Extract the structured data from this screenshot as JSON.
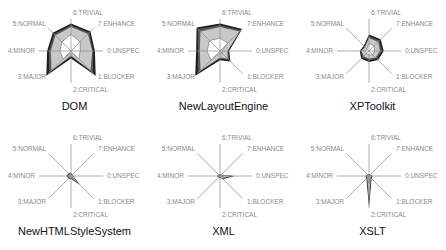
{
  "axes": [
    "0:UNSPEC",
    "1:BLOCKER",
    "2:CRITICAL",
    "3:MAJOR",
    "4:MINOR",
    "5:NORMAL",
    "6:TRIVIAL",
    "7:ENHANCE"
  ],
  "colors": {
    "outer": "#1e1e1e",
    "middle": "#5a5a5a",
    "fill": "#c8c8c8",
    "inner": "#ffffff",
    "axis": "#8c8c8c",
    "label": "#8a8a8a"
  },
  "chart_data": [
    {
      "type": "radar",
      "title": "DOM",
      "axes": [
        "0:UNSPEC",
        "1:BLOCKER",
        "2:CRITICAL",
        "3:MAJOR",
        "4:MINOR",
        "5:NORMAL",
        "6:TRIVIAL",
        "7:ENHANCE"
      ],
      "series": [
        {
          "name": "outer",
          "values": [
            0.65,
            0.75,
            0.75,
            0.7,
            0.65,
            0.95,
            0.2,
            0.95
          ]
        },
        {
          "name": "middle",
          "values": [
            0.6,
            0.7,
            0.7,
            0.65,
            0.6,
            0.85,
            0.15,
            0.85
          ]
        },
        {
          "name": "fill",
          "values": [
            0.58,
            0.65,
            0.65,
            0.6,
            0.55,
            0.75,
            0.12,
            0.75
          ]
        },
        {
          "name": "inner",
          "values": [
            0.25,
            0.35,
            0.45,
            0.35,
            0.3,
            0.3,
            0.05,
            0.3
          ]
        }
      ]
    },
    {
      "type": "radar",
      "title": "NewLayoutEngine",
      "axes": [
        "0:UNSPEC",
        "1:BLOCKER",
        "2:CRITICAL",
        "3:MAJOR",
        "4:MINOR",
        "5:NORMAL",
        "6:TRIVIAL",
        "7:ENHANCE"
      ],
      "series": [
        {
          "name": "outer",
          "values": [
            0.25,
            0.85,
            0.75,
            0.9,
            0.65,
            0.95,
            0.25,
            0.4
          ]
        },
        {
          "name": "middle",
          "values": [
            0.22,
            0.8,
            0.7,
            0.85,
            0.6,
            0.85,
            0.2,
            0.35
          ]
        },
        {
          "name": "fill",
          "values": [
            0.2,
            0.75,
            0.65,
            0.75,
            0.55,
            0.75,
            0.18,
            0.3
          ]
        },
        {
          "name": "inner",
          "values": [
            0.05,
            0.3,
            0.35,
            0.4,
            0.35,
            0.35,
            0.05,
            0.1
          ]
        }
      ]
    },
    {
      "type": "radar",
      "title": "XPToolkit",
      "axes": [
        "0:UNSPEC",
        "1:BLOCKER",
        "2:CRITICAL",
        "3:MAJOR",
        "4:MINOR",
        "5:NORMAL",
        "6:TRIVIAL",
        "7:ENHANCE"
      ],
      "series": [
        {
          "name": "outer",
          "values": [
            0.4,
            0.45,
            0.45,
            0.2,
            0.25,
            0.3,
            0.3,
            0.35
          ]
        },
        {
          "name": "middle",
          "values": [
            0.35,
            0.4,
            0.4,
            0.17,
            0.22,
            0.25,
            0.25,
            0.3
          ]
        },
        {
          "name": "fill",
          "values": [
            0.3,
            0.35,
            0.35,
            0.15,
            0.2,
            0.2,
            0.2,
            0.25
          ]
        },
        {
          "name": "inner",
          "values": [
            0.15,
            0.2,
            0.2,
            0.08,
            0.1,
            0.1,
            0.1,
            0.15
          ]
        }
      ]
    },
    {
      "type": "radar",
      "title": "NewHTMLStyleSystem",
      "axes": [
        "0:UNSPEC",
        "1:BLOCKER",
        "2:CRITICAL",
        "3:MAJOR",
        "4:MINOR",
        "5:NORMAL",
        "6:TRIVIAL",
        "7:ENHANCE"
      ],
      "series": [
        {
          "name": "outer",
          "values": [
            0.06,
            0.05,
            0.08,
            0.1,
            0.12,
            0.1,
            0.08,
            0.35
          ]
        },
        {
          "name": "middle",
          "values": [
            0.05,
            0.04,
            0.07,
            0.08,
            0.1,
            0.08,
            0.06,
            0.3
          ]
        },
        {
          "name": "fill",
          "values": [
            0.04,
            0.03,
            0.05,
            0.06,
            0.08,
            0.06,
            0.05,
            0.25
          ]
        },
        {
          "name": "inner",
          "values": [
            0.02,
            0.02,
            0.03,
            0.03,
            0.04,
            0.03,
            0.02,
            0.1
          ]
        }
      ]
    },
    {
      "type": "radar",
      "title": "XML",
      "axes": [
        "0:UNSPEC",
        "1:BLOCKER",
        "2:CRITICAL",
        "3:MAJOR",
        "4:MINOR",
        "5:NORMAL",
        "6:TRIVIAL",
        "7:ENHANCE"
      ],
      "series": [
        {
          "name": "outer",
          "values": [
            0.4,
            0.05,
            0.05,
            0.05,
            0.08,
            0.06,
            0.05,
            0.12
          ]
        },
        {
          "name": "middle",
          "values": [
            0.35,
            0.04,
            0.04,
            0.04,
            0.07,
            0.05,
            0.04,
            0.1
          ]
        },
        {
          "name": "fill",
          "values": [
            0.3,
            0.03,
            0.03,
            0.03,
            0.05,
            0.04,
            0.03,
            0.08
          ]
        },
        {
          "name": "inner",
          "values": [
            0.1,
            0.01,
            0.01,
            0.01,
            0.02,
            0.02,
            0.01,
            0.03
          ]
        }
      ]
    },
    {
      "type": "radar",
      "title": "XSLT",
      "axes": [
        "0:UNSPEC",
        "1:BLOCKER",
        "2:CRITICAL",
        "3:MAJOR",
        "4:MINOR",
        "5:NORMAL",
        "6:TRIVIAL",
        "7:ENHANCE"
      ],
      "series": [
        {
          "name": "outer",
          "values": [
            0.1,
            0.05,
            0.05,
            0.05,
            0.1,
            0.1,
            0.85,
            0.1
          ]
        },
        {
          "name": "middle",
          "values": [
            0.08,
            0.04,
            0.04,
            0.04,
            0.08,
            0.08,
            0.75,
            0.08
          ]
        },
        {
          "name": "fill",
          "values": [
            0.06,
            0.03,
            0.03,
            0.03,
            0.06,
            0.06,
            0.6,
            0.06
          ]
        },
        {
          "name": "inner",
          "values": [
            0.02,
            0.01,
            0.01,
            0.01,
            0.02,
            0.02,
            0.2,
            0.02
          ]
        }
      ]
    }
  ]
}
